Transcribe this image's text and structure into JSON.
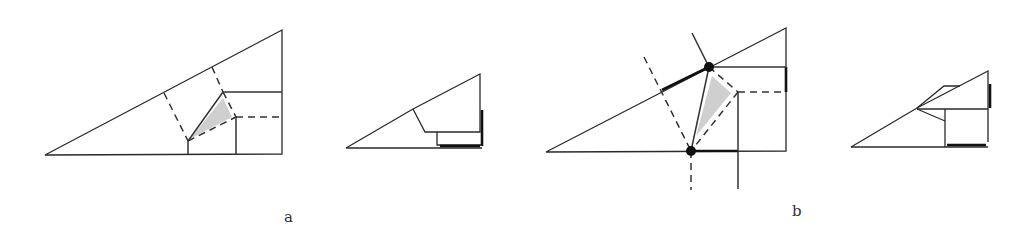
{
  "figures": [
    {
      "id": "a-crease-pattern",
      "description": "Right triangle crease pattern with dashed valley folds and shaded triangle"
    },
    {
      "id": "a-folded",
      "description": "Folded result of crease pattern a"
    },
    {
      "id": "b-crease-pattern",
      "description": "Crease pattern with two marked reference points and extended fold lines"
    },
    {
      "id": "b-folded",
      "description": "Folded result of crease pattern b"
    }
  ],
  "labels": {
    "a": "a",
    "b": "b"
  },
  "colors": {
    "line": "#2a2a2a",
    "shade": "#cfcfcf",
    "dot": "#111111"
  }
}
